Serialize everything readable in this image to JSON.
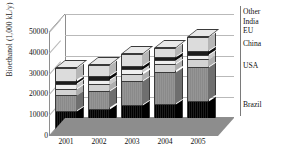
{
  "title_partial": "",
  "axes": {
    "y_title": "Bioethanol (1,000 kL/y)",
    "y_ticks": [
      "0",
      "10000",
      "20000",
      "30000",
      "40000",
      "50000"
    ],
    "x_ticks": [
      "2001",
      "2002",
      "2003",
      "2004",
      "2005"
    ]
  },
  "legend": {
    "items": [
      {
        "label": "Other",
        "color": "#dcdcdc"
      },
      {
        "label": "India",
        "color": "#1c1c1c"
      },
      {
        "label": "EU",
        "color": "#efefef"
      },
      {
        "label": "China",
        "color": "#d2d2d2"
      },
      {
        "label": "USA",
        "color": "#8c8c8c"
      },
      {
        "label": "Brazil",
        "color": "#0d0d0d"
      }
    ]
  },
  "chart_data": {
    "type": "bar",
    "subtype": "stacked-column-3d",
    "title": "",
    "xlabel": "",
    "ylabel": "Bioethanol (1,000 kL/y)",
    "ylim": [
      0,
      50000
    ],
    "ytick_step": 10000,
    "grid": true,
    "legend_position": "right",
    "categories": [
      "2001",
      "2002",
      "2003",
      "2004",
      "2005"
    ],
    "series": [
      {
        "name": "Brazil",
        "color": "#0d0d0d",
        "values": [
          12000,
          13200,
          15000,
          15500,
          17000
        ]
      },
      {
        "name": "USA",
        "color": "#8c8c8c",
        "values": [
          7500,
          8300,
          11500,
          15500,
          16000
        ]
      },
      {
        "name": "China",
        "color": "#d2d2d2",
        "values": [
          3200,
          3300,
          3500,
          3500,
          3800
        ]
      },
      {
        "name": "EU",
        "color": "#efefef",
        "values": [
          2200,
          2300,
          2000,
          2000,
          2200
        ]
      },
      {
        "name": "India",
        "color": "#1c1c1c",
        "values": [
          1600,
          1700,
          1800,
          1700,
          1800
        ]
      },
      {
        "name": "Other",
        "color": "#dcdcdc",
        "values": [
          6000,
          5200,
          5700,
          4300,
          6700
        ]
      }
    ],
    "totals": [
      32500,
      34000,
      39500,
      42500,
      47500
    ]
  }
}
